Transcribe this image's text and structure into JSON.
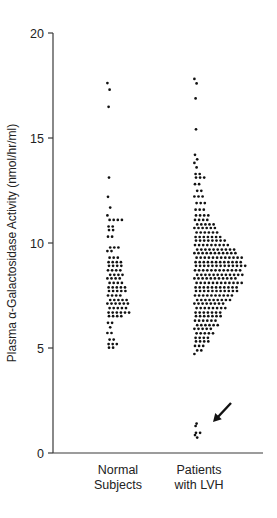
{
  "chart_data": {
    "type": "scatter",
    "subtype": "dot-strip",
    "title": "",
    "xlabel": "",
    "ylabel": "Plasma α-Galactosidase Activity (nmol/hr/ml)",
    "ylim": [
      0,
      20
    ],
    "yticks": [
      "0",
      "5",
      "10",
      "15",
      "20"
    ],
    "grid": false,
    "legend": null,
    "categories": [
      "Normal\nSubjects",
      "Patients\nwith LVH"
    ],
    "category_lines": [
      [
        "Normal",
        "Subjects"
      ],
      [
        "Patients",
        "with LVH"
      ]
    ],
    "series": [
      {
        "name": "Normal Subjects",
        "levels": [
          [
            17.6,
            1
          ],
          [
            17.3,
            1
          ],
          [
            16.5,
            1
          ],
          [
            13.1,
            1
          ],
          [
            12.2,
            1
          ],
          [
            11.7,
            1
          ],
          [
            11.3,
            1
          ],
          [
            11.1,
            4
          ],
          [
            10.8,
            2
          ],
          [
            10.6,
            2
          ],
          [
            10.3,
            2
          ],
          [
            9.8,
            3
          ],
          [
            9.6,
            2
          ],
          [
            9.3,
            3
          ],
          [
            9.1,
            4
          ],
          [
            8.9,
            4
          ],
          [
            8.7,
            4
          ],
          [
            8.5,
            4
          ],
          [
            8.3,
            4
          ],
          [
            8.1,
            4
          ],
          [
            7.9,
            5
          ],
          [
            7.7,
            5
          ],
          [
            7.5,
            4
          ],
          [
            7.3,
            5
          ],
          [
            7.1,
            6
          ],
          [
            6.9,
            5
          ],
          [
            6.7,
            6
          ],
          [
            6.5,
            4
          ],
          [
            6.2,
            2
          ],
          [
            6.0,
            1
          ],
          [
            5.7,
            2
          ],
          [
            5.4,
            2
          ],
          [
            5.2,
            3
          ],
          [
            5.0,
            2
          ]
        ]
      },
      {
        "name": "Patients with LVH",
        "levels": [
          [
            17.8,
            1
          ],
          [
            17.6,
            1
          ],
          [
            16.9,
            1
          ],
          [
            15.4,
            1
          ],
          [
            14.2,
            1
          ],
          [
            14.0,
            1
          ],
          [
            13.8,
            1
          ],
          [
            13.6,
            1
          ],
          [
            13.3,
            2
          ],
          [
            13.1,
            3
          ],
          [
            12.8,
            2
          ],
          [
            12.5,
            2
          ],
          [
            12.2,
            3
          ],
          [
            11.9,
            3
          ],
          [
            11.6,
            3
          ],
          [
            11.3,
            4
          ],
          [
            11.1,
            4
          ],
          [
            10.9,
            5
          ],
          [
            10.7,
            6
          ],
          [
            10.5,
            6
          ],
          [
            10.3,
            7
          ],
          [
            10.1,
            8
          ],
          [
            9.9,
            9
          ],
          [
            9.7,
            10
          ],
          [
            9.5,
            11
          ],
          [
            9.3,
            12
          ],
          [
            9.1,
            12
          ],
          [
            8.9,
            13
          ],
          [
            8.7,
            12
          ],
          [
            8.5,
            12
          ],
          [
            8.3,
            11
          ],
          [
            8.1,
            12
          ],
          [
            7.9,
            11
          ],
          [
            7.7,
            11
          ],
          [
            7.5,
            10
          ],
          [
            7.3,
            9
          ],
          [
            7.1,
            8
          ],
          [
            6.9,
            8
          ],
          [
            6.7,
            7
          ],
          [
            6.5,
            7
          ],
          [
            6.3,
            6
          ],
          [
            6.1,
            6
          ],
          [
            5.9,
            5
          ],
          [
            5.7,
            5
          ],
          [
            5.5,
            4
          ],
          [
            5.3,
            4
          ],
          [
            5.1,
            3
          ],
          [
            4.9,
            2
          ],
          [
            4.7,
            1
          ],
          [
            1.4,
            1
          ],
          [
            1.3,
            1
          ],
          [
            0.95,
            2
          ],
          [
            0.85,
            1
          ],
          [
            0.75,
            1
          ]
        ]
      }
    ],
    "annotations": [
      {
        "type": "arrow",
        "points_to": "Patients with LVH outliers near 1 nmol/hr/ml",
        "from": [
          231,
          403
        ],
        "to": [
          213,
          422
        ]
      }
    ]
  }
}
